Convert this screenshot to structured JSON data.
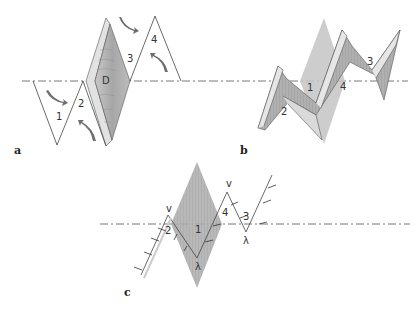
{
  "figure": {
    "panels": [
      {
        "id": "a",
        "label": "a",
        "description": "Unfolded zigzag of four triangles along a dash-dot axis with central shaded diamond D; curved arrows indicate folding direction",
        "segment_labels": [
          "1",
          "2",
          "3",
          "4"
        ],
        "center_label": "D"
      },
      {
        "id": "b",
        "label": "b",
        "description": "Three-dimensional folded zigzag strip with shaded surfaces crossing the axis",
        "segment_labels": [
          "1",
          "2",
          "3",
          "4"
        ]
      },
      {
        "id": "c",
        "label": "c",
        "description": "Line zigzag with tick marks and small fold symbols crossing shaded diamond",
        "segment_labels": [
          "1",
          "2",
          "3",
          "4"
        ],
        "fold_marks": [
          "v",
          "v",
          "λ",
          "λ"
        ]
      }
    ],
    "colors": {
      "line": "#444444",
      "axis": "#555555",
      "shade_dark": "#9a9a9a",
      "shade_light": "#d4d4d4",
      "arrow": "#6e6e6e"
    }
  }
}
